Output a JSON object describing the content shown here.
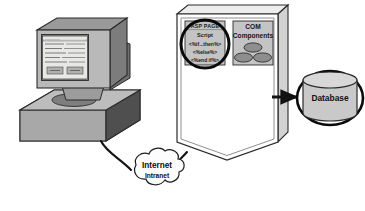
{
  "diagram": {
    "colors": {
      "outline": "#2b2b2b",
      "monitor_face": "#b9b9b9",
      "monitor_side": "#7c7c7c",
      "monitor_top": "#9a9a9a",
      "screen": "#e8e8e6",
      "case_top": "#b3b3b3",
      "case_front": "#9d9d9d",
      "case_side": "#4f4f4f",
      "server_body": "#ffffff",
      "server_edge": "#8f8f8f",
      "panel_fill": "#c4c4c4",
      "oval_fill": "#8e8e8e",
      "cylinder_fill": "#c9c9c9",
      "cylinder_top": "#d8d8d8",
      "cloud_fill": "#fdfdfd",
      "arrow": "#111111",
      "highlight_circle": "#0a0a0a"
    },
    "client": {
      "name": "Client computer",
      "screen": {
        "window_title": "",
        "form_lines": [
          "",
          "",
          "",
          "",
          ""
        ],
        "buttons": [
          "",
          ""
        ]
      }
    },
    "server": {
      "name": "Web server",
      "asp_page": {
        "header": "ASP PAGE",
        "script_label": "Script",
        "code_lines": [
          "<%if...then%>",
          "<%else%>",
          "<%end if%>"
        ]
      },
      "com": {
        "label_line1": "COM",
        "label_line2": "Components",
        "component_count": 3
      }
    },
    "database": {
      "label": "Database"
    },
    "network": {
      "label_primary": "Internet",
      "label_secondary": "Intranet"
    },
    "connections": [
      {
        "name": "client-to-network",
        "from": "client",
        "to": "network",
        "style": "line"
      },
      {
        "name": "network-to-server",
        "from": "network",
        "to": "server",
        "style": "line"
      },
      {
        "name": "server-to-database",
        "from": "server",
        "to": "database",
        "style": "arrow"
      }
    ]
  }
}
